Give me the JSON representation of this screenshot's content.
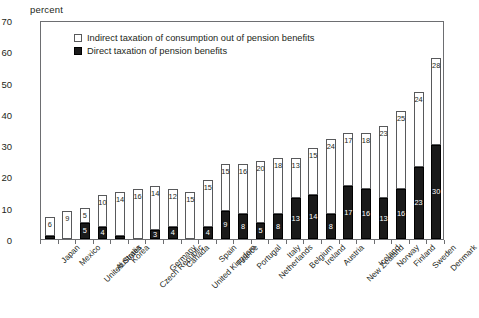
{
  "chart_data": {
    "type": "bar",
    "stacked": true,
    "title": "",
    "subtitle": "",
    "xlabel": "",
    "ylabel": "percent",
    "ylim": [
      0,
      70
    ],
    "ytick_step": 10,
    "yticks": [
      0,
      10,
      20,
      30,
      40,
      50,
      60,
      70
    ],
    "grid": false,
    "legend_position": "top-left",
    "categories": [
      "Japan",
      "Mexico",
      "United States",
      "Australia",
      "Korea",
      "Czech Republic",
      "Germany",
      "Canada",
      "United Kingdom",
      "Spain",
      "France",
      "Portugal",
      "Netherlands",
      "Italy",
      "Belgium",
      "Ireland",
      "Austria",
      "New Zealand",
      "Iceland",
      "Norway",
      "Finland",
      "Sweden",
      "Denmark"
    ],
    "series": [
      {
        "name": "Direct taxation of pension benefits",
        "color": "#1a1a1a",
        "values": [
          1,
          0,
          5,
          4,
          1,
          0,
          3,
          4,
          0,
          4,
          9,
          8,
          5,
          8,
          13,
          14,
          8,
          17,
          16,
          13,
          16,
          23,
          30
        ],
        "labels": [
          "",
          "",
          "5",
          "4",
          "",
          "",
          "3",
          "4",
          "",
          "4",
          "9",
          "8",
          "5",
          "8",
          "13",
          "14",
          "8",
          "17",
          "16",
          "13",
          "16",
          "23",
          "30"
        ]
      },
      {
        "name": "Indirect taxation of consumption out of pension benefits",
        "color": "#ffffff",
        "values": [
          6,
          9,
          5,
          10,
          14,
          16,
          14,
          12,
          15,
          15,
          15,
          16,
          20,
          18,
          13,
          15,
          24,
          17,
          18,
          23,
          25,
          24,
          28
        ],
        "labels": [
          "6",
          "9",
          "5",
          "10",
          "14",
          "16",
          "14",
          "12",
          "15",
          "15",
          "15",
          "16",
          "20",
          "18",
          "13",
          "15",
          "24",
          "17",
          "18",
          "23",
          "25",
          "24",
          "28"
        ]
      }
    ],
    "totals": [
      7,
      9,
      10,
      14,
      15,
      16,
      17,
      16,
      15,
      19,
      24,
      24,
      25,
      26,
      26,
      29,
      32,
      34,
      34,
      36,
      41,
      47,
      58
    ]
  },
  "legend": {
    "items": [
      {
        "label": "Indirect taxation of consumption out of pension benefits",
        "swatch": "white-square"
      },
      {
        "label": "Direct taxation of pension benefits",
        "swatch": "black-square"
      }
    ]
  }
}
